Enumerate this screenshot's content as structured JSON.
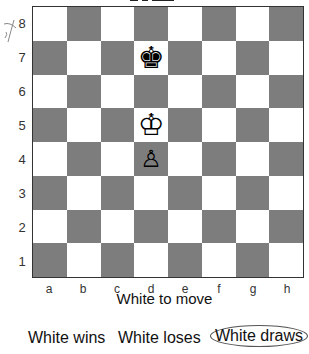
{
  "puzzle": {
    "side_to_move": "White to move",
    "files": [
      "a",
      "b",
      "c",
      "d",
      "e",
      "f",
      "g",
      "h"
    ],
    "ranks": [
      "8",
      "7",
      "6",
      "5",
      "4",
      "3",
      "2",
      "1"
    ],
    "colors": {
      "light_square": "#ffffff",
      "dark_square": "#7d7d7d"
    },
    "pieces": [
      {
        "square": "d7",
        "piece": "black-king",
        "glyph": "♚"
      },
      {
        "square": "d5",
        "piece": "white-king",
        "glyph": "♔"
      },
      {
        "square": "d4",
        "piece": "white-pawn",
        "glyph": "♙"
      }
    ]
  },
  "answer_options": [
    {
      "label": "White wins",
      "selected": false
    },
    {
      "label": "White loses",
      "selected": false
    },
    {
      "label": "White draws",
      "selected": true
    }
  ]
}
